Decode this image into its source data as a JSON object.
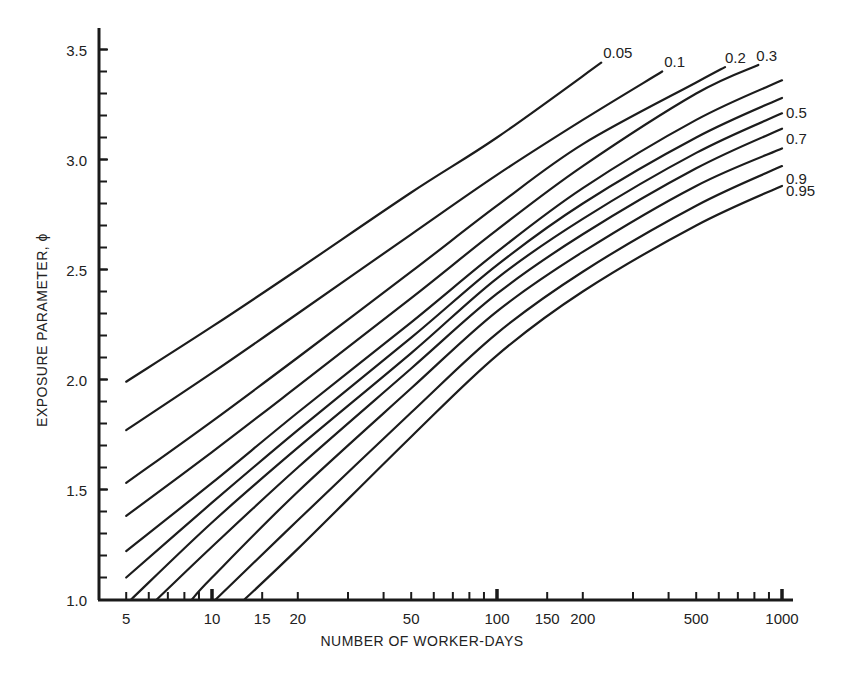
{
  "chart_data": {
    "type": "line",
    "title": "",
    "xlabel": "NUMBER OF WORKER-DAYS",
    "ylabel": "EXPOSURE PARAMETER, ϕ",
    "xscale": "log",
    "xlim": [
      4.2,
      1150
    ],
    "ylim": [
      1.0,
      3.6
    ],
    "grid": false,
    "legend": "inline labels at curve ends",
    "x_ticks": [
      {
        "value": 5,
        "label": "5"
      },
      {
        "value": 10,
        "label": "10"
      },
      {
        "value": 15,
        "label": "15"
      },
      {
        "value": 20,
        "label": "20"
      },
      {
        "value": 50,
        "label": "50"
      },
      {
        "value": 100,
        "label": "100"
      },
      {
        "value": 150,
        "label": "150"
      },
      {
        "value": 200,
        "label": "200"
      },
      {
        "value": 500,
        "label": "500"
      },
      {
        "value": 1000,
        "label": "1000"
      }
    ],
    "x_minor_ticks": [
      6,
      7,
      8,
      9,
      30,
      40,
      60,
      70,
      80,
      90,
      300,
      400,
      600,
      700,
      800,
      900
    ],
    "y_ticks": [
      {
        "value": 1.0,
        "label": "1.0"
      },
      {
        "value": 1.5,
        "label": "1.5"
      },
      {
        "value": 2.0,
        "label": "2.0"
      },
      {
        "value": 2.5,
        "label": "2.5"
      },
      {
        "value": 3.0,
        "label": "3.0"
      },
      {
        "value": 3.5,
        "label": "3.5"
      }
    ],
    "y_minor_step": 0.1,
    "series": [
      {
        "name": "0.05",
        "label": "0.05",
        "labeled": true,
        "points": [
          [
            5,
            1.99
          ],
          [
            10,
            2.24
          ],
          [
            20,
            2.5
          ],
          [
            50,
            2.85
          ],
          [
            100,
            3.1
          ],
          [
            232,
            3.44
          ]
        ]
      },
      {
        "name": "0.1",
        "label": "0.1",
        "labeled": true,
        "points": [
          [
            5,
            1.77
          ],
          [
            10,
            2.03
          ],
          [
            20,
            2.3
          ],
          [
            50,
            2.66
          ],
          [
            100,
            2.93
          ],
          [
            200,
            3.18
          ],
          [
            380,
            3.4
          ]
        ]
      },
      {
        "name": "0.2",
        "label": "0.2",
        "labeled": true,
        "points": [
          [
            5,
            1.53
          ],
          [
            10,
            1.81
          ],
          [
            20,
            2.1
          ],
          [
            50,
            2.49
          ],
          [
            100,
            2.79
          ],
          [
            200,
            3.07
          ],
          [
            500,
            3.35
          ],
          [
            631,
            3.42
          ]
        ]
      },
      {
        "name": "0.3",
        "label": "0.3",
        "labeled": true,
        "points": [
          [
            5,
            1.38
          ],
          [
            10,
            1.67
          ],
          [
            20,
            1.97
          ],
          [
            50,
            2.37
          ],
          [
            100,
            2.68
          ],
          [
            200,
            2.97
          ],
          [
            500,
            3.3
          ],
          [
            826,
            3.43
          ]
        ]
      },
      {
        "name": "0.4",
        "label": "",
        "labeled": false,
        "points": [
          [
            5,
            1.22
          ],
          [
            10,
            1.53
          ],
          [
            20,
            1.85
          ],
          [
            50,
            2.26
          ],
          [
            100,
            2.58
          ],
          [
            200,
            2.87
          ],
          [
            500,
            3.18
          ],
          [
            1000,
            3.36
          ]
        ]
      },
      {
        "name": "0.5",
        "label": "0.5",
        "labeled": true,
        "points": [
          [
            5,
            1.1
          ],
          [
            10,
            1.44
          ],
          [
            20,
            1.77
          ],
          [
            50,
            2.19
          ],
          [
            100,
            2.52
          ],
          [
            200,
            2.8
          ],
          [
            500,
            3.1
          ],
          [
            1000,
            3.28
          ]
        ]
      },
      {
        "name": "0.6",
        "label": "",
        "labeled": false,
        "points": [
          [
            5.2,
            1.0
          ],
          [
            10,
            1.35
          ],
          [
            20,
            1.69
          ],
          [
            50,
            2.12
          ],
          [
            100,
            2.46
          ],
          [
            200,
            2.73
          ],
          [
            500,
            3.03
          ],
          [
            1000,
            3.21
          ]
        ]
      },
      {
        "name": "0.7",
        "label": "0.7",
        "labeled": true,
        "points": [
          [
            6.4,
            1.0
          ],
          [
            10,
            1.24
          ],
          [
            20,
            1.6
          ],
          [
            50,
            2.05
          ],
          [
            100,
            2.39
          ],
          [
            200,
            2.66
          ],
          [
            500,
            2.96
          ],
          [
            1000,
            3.14
          ]
        ]
      },
      {
        "name": "0.8",
        "label": "",
        "labeled": false,
        "points": [
          [
            8.5,
            1.0
          ],
          [
            10,
            1.1
          ],
          [
            20,
            1.49
          ],
          [
            50,
            1.96
          ],
          [
            100,
            2.31
          ],
          [
            200,
            2.58
          ],
          [
            500,
            2.88
          ],
          [
            1000,
            3.05
          ]
        ]
      },
      {
        "name": "0.9",
        "label": "0.9",
        "labeled": true,
        "points": [
          [
            10.3,
            1.0
          ],
          [
            20,
            1.36
          ],
          [
            50,
            1.85
          ],
          [
            100,
            2.21
          ],
          [
            200,
            2.49
          ],
          [
            500,
            2.79
          ],
          [
            1000,
            2.97
          ]
        ]
      },
      {
        "name": "0.95",
        "label": "0.95",
        "labeled": true,
        "points": [
          [
            13,
            1.0
          ],
          [
            20,
            1.23
          ],
          [
            50,
            1.74
          ],
          [
            100,
            2.11
          ],
          [
            200,
            2.4
          ],
          [
            500,
            2.7
          ],
          [
            1000,
            2.88
          ]
        ]
      }
    ]
  }
}
